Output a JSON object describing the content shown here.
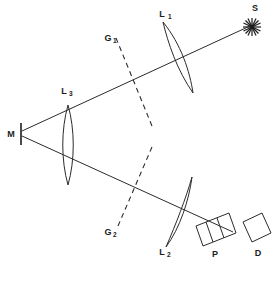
{
  "figure": {
    "type": "optical-ray-diagram",
    "background_color": "#ffffff",
    "stroke_color": "#2b2b2b",
    "width": 277,
    "height": 284
  },
  "labels": {
    "source": "S",
    "lens1_main": "L",
    "lens1_sub": "1",
    "lens2_main": "L",
    "lens2_sub": "2",
    "lens3_main": "L",
    "lens3_sub": "3",
    "grating1_main": "G",
    "grating1_sub": "1",
    "grating2_main": "G",
    "grating2_sub": "2",
    "mirror": "M",
    "polarizer": "P",
    "detector": "D"
  },
  "components": [
    {
      "name": "source",
      "label": "S",
      "kind": "star-burst"
    },
    {
      "name": "lens-1",
      "label": "L1",
      "kind": "biconvex-lens"
    },
    {
      "name": "grating-1",
      "label": "G1",
      "kind": "dashed-plane"
    },
    {
      "name": "lens-3",
      "label": "L3",
      "kind": "biconvex-lens"
    },
    {
      "name": "mirror",
      "label": "M",
      "kind": "plane-mirror"
    },
    {
      "name": "grating-2",
      "label": "G2",
      "kind": "dashed-plane"
    },
    {
      "name": "lens-2",
      "label": "L2",
      "kind": "biconvex-lens"
    },
    {
      "name": "polarizer",
      "label": "P",
      "kind": "segmented-block"
    },
    {
      "name": "detector",
      "label": "D",
      "kind": "rectangular-block"
    }
  ]
}
